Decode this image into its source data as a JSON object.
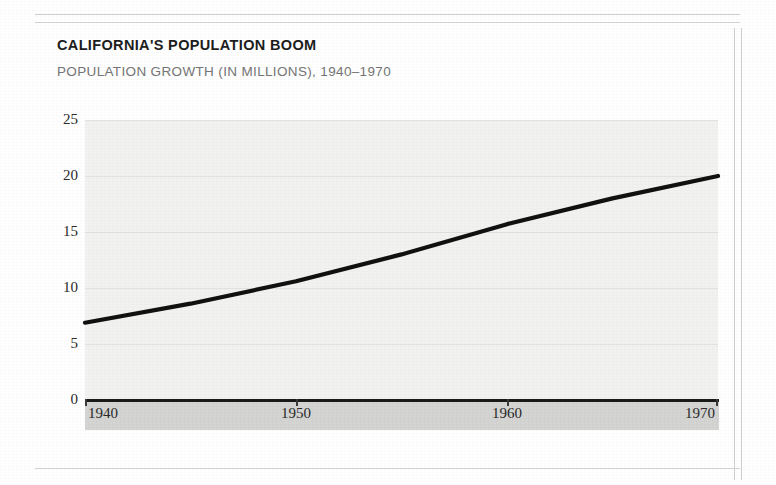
{
  "figure": {
    "title": "CALIFORNIA'S POPULATION BOOM",
    "subtitle": "POPULATION GROWTH (IN MILLIONS), 1940–1970"
  },
  "colors": {
    "title_text": "#1d1d1d",
    "subtitle_text": "#757575",
    "plot_background": "#f2f2f1",
    "gridline": "#e2e2e0",
    "axis": "#1a1a1a",
    "series_line": "#111111",
    "x_band": "#d4d4d2",
    "page_rule": "#cfcfcf"
  },
  "chart_data": {
    "type": "line",
    "title": "CALIFORNIA'S POPULATION BOOM",
    "subtitle": "POPULATION GROWTH (IN MILLIONS), 1940–1970",
    "xlabel": "",
    "ylabel": "",
    "x": [
      1940,
      1945,
      1950,
      1955,
      1960,
      1965,
      1970
    ],
    "xlim": [
      1940,
      1970
    ],
    "ylim": [
      0,
      25
    ],
    "xticks": [
      1940,
      1950,
      1960,
      1970
    ],
    "xticklabels": [
      "1940",
      "1950",
      "1960",
      "1970"
    ],
    "yticks": [
      0,
      5,
      10,
      15,
      20,
      25
    ],
    "yticklabels": [
      "0",
      "5",
      "10",
      "15",
      "20",
      "25"
    ],
    "grid": "horizontal",
    "legend": "none",
    "series": [
      {
        "name": "California population (millions)",
        "values": [
          6.9,
          8.6,
          10.6,
          13.0,
          15.7,
          18.0,
          20.0
        ]
      }
    ]
  }
}
